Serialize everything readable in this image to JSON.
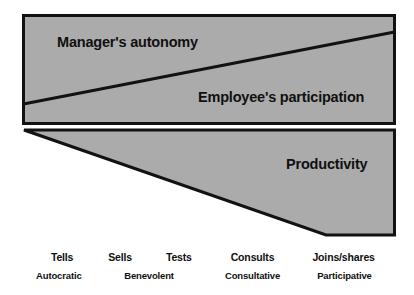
{
  "diagram": {
    "type": "management-style-continuum",
    "colors": {
      "fill": "#ababab",
      "stroke": "#121212",
      "text": "#101010",
      "background": "#ffffff"
    },
    "upper_band": {
      "manager_label": "Manager's autonomy",
      "employee_label": "Employee's participation"
    },
    "lower_band": {
      "productivity_label": "Productivity"
    },
    "scale": {
      "primary": [
        {
          "label": "Tells",
          "x_pct": 15.0
        },
        {
          "label": "Sells",
          "x_pct": 29.0
        },
        {
          "label": "Tests",
          "x_pct": 43.2
        },
        {
          "label": "Consults",
          "x_pct": 61.0
        },
        {
          "label": "Joins/shares",
          "x_pct": 83.0
        }
      ],
      "secondary": [
        {
          "label": "Autocratic",
          "x_pct": 14.2
        },
        {
          "label": "Benevolent",
          "x_pct": 36.0
        },
        {
          "label": "Consultative",
          "x_pct": 61.0
        },
        {
          "label": "Participative",
          "x_pct": 83.2
        }
      ]
    }
  },
  "chart_data": {
    "type": "area",
    "title": "",
    "subtitle": "",
    "xlabel": "",
    "ylabel": "",
    "grid": false,
    "legend_position": "none",
    "x": [
      "Tells",
      "Sells",
      "Tests",
      "Consults",
      "Joins/shares"
    ],
    "xlim": [
      0,
      100
    ],
    "ylim": [
      0,
      100
    ],
    "annotations": [
      "Manager's autonomy",
      "Employee's participation",
      "Productivity"
    ],
    "series": [
      {
        "name": "Manager's autonomy",
        "description": "Decreasing wedge across the upper band, widest at left, narrowest at right",
        "values": [
          100,
          79,
          58,
          37,
          16
        ]
      },
      {
        "name": "Employee's participation",
        "description": "Increasing wedge across the upper band, narrowest at left, widest at right",
        "values": [
          0,
          21,
          42,
          63,
          84
        ]
      },
      {
        "name": "Productivity",
        "description": "Increasing wedge across the lower band, zero at left, maximum at right",
        "values": [
          0,
          25,
          50,
          75,
          100
        ]
      }
    ]
  }
}
